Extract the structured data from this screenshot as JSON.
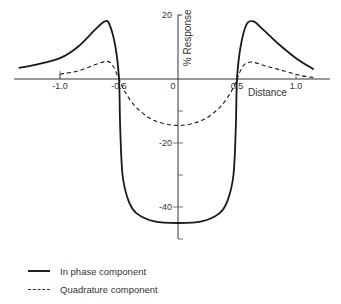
{
  "chart_data": {
    "type": "line",
    "title": "",
    "xlabel": "Distance",
    "ylabel": "% Response",
    "xlim": [
      -1.4,
      1.2
    ],
    "ylim": [
      -50,
      20
    ],
    "x_ticks": [
      -1.0,
      -0.5,
      0,
      0.5,
      1.0
    ],
    "x_tick_labels": [
      "-1.0",
      "-0.5",
      "0",
      "0.5",
      "1.0"
    ],
    "y_ticks": [
      20,
      -20,
      -40
    ],
    "y_tick_labels": [
      "20",
      "-20",
      "-40"
    ],
    "y_minor_ticks": [
      -10,
      -30,
      -50
    ],
    "grid": false,
    "legend_position": "bottom-left",
    "series": [
      {
        "name": "In phase component",
        "style": "solid",
        "points": [
          [
            -1.35,
            3.5
          ],
          [
            -1.2,
            4.5
          ],
          [
            -1.0,
            6.5
          ],
          [
            -0.85,
            10
          ],
          [
            -0.7,
            15.5
          ],
          [
            -0.62,
            18
          ],
          [
            -0.58,
            17
          ],
          [
            -0.53,
            10
          ],
          [
            -0.5,
            0
          ],
          [
            -0.49,
            -15
          ],
          [
            -0.47,
            -30
          ],
          [
            -0.42,
            -38
          ],
          [
            -0.35,
            -42
          ],
          [
            -0.2,
            -44.5
          ],
          [
            0,
            -45
          ],
          [
            0.2,
            -44.5
          ],
          [
            0.35,
            -42
          ],
          [
            0.42,
            -38
          ],
          [
            0.47,
            -30
          ],
          [
            0.49,
            -15
          ],
          [
            0.5,
            0
          ],
          [
            0.53,
            10
          ],
          [
            0.58,
            17
          ],
          [
            0.64,
            18
          ],
          [
            0.72,
            15.5
          ],
          [
            0.85,
            11
          ],
          [
            1.0,
            6.5
          ],
          [
            1.15,
            3
          ]
        ]
      },
      {
        "name": "Quadrature component",
        "style": "dashed",
        "points": [
          [
            -1.0,
            1.5
          ],
          [
            -0.85,
            2.5
          ],
          [
            -0.7,
            4.5
          ],
          [
            -0.6,
            5.5
          ],
          [
            -0.55,
            4
          ],
          [
            -0.5,
            0
          ],
          [
            -0.45,
            -4
          ],
          [
            -0.35,
            -9
          ],
          [
            -0.2,
            -13
          ],
          [
            0,
            -14.5
          ],
          [
            0.2,
            -13
          ],
          [
            0.35,
            -9
          ],
          [
            0.45,
            -4
          ],
          [
            0.5,
            0
          ],
          [
            0.55,
            4
          ],
          [
            0.62,
            5.3
          ],
          [
            0.75,
            4
          ],
          [
            0.9,
            2.5
          ],
          [
            1.05,
            1
          ],
          [
            1.15,
            0.5
          ]
        ]
      }
    ]
  },
  "axes": {
    "xlabel": "Distance",
    "ylabel": "% Response"
  },
  "legend": {
    "items": [
      {
        "label": "In phase component",
        "style": "solid"
      },
      {
        "label": "Quadrature component",
        "style": "dashed"
      }
    ]
  }
}
